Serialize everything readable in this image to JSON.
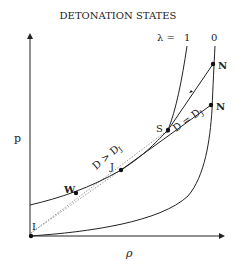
{
  "title": "DETONATION STATES",
  "axes": {
    "y_label": "p",
    "x_label": "ρ"
  },
  "lambda_label": {
    "prefix": "λ =",
    "curve_1": "1",
    "curve_0": "0"
  },
  "points": {
    "N_top": "N",
    "N_mid": "N",
    "S": "S",
    "J": "J",
    "W": "W",
    "I": "I"
  },
  "line_labels": {
    "overdriven": "D > D",
    "overdriven_sub": "J",
    "cj": "D = D",
    "cj_sub": "J"
  },
  "colors": {
    "line": "#222222",
    "dotted": "#9a9a9a"
  }
}
